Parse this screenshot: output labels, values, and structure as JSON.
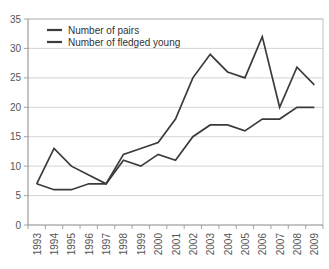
{
  "chart_data": {
    "type": "line",
    "title": "",
    "xlabel": "",
    "ylabel": "",
    "x": [
      1993,
      1994,
      1995,
      1996,
      1997,
      1998,
      1999,
      2000,
      2001,
      2002,
      2003,
      2004,
      2005,
      2006,
      2007,
      2008,
      2009
    ],
    "categories": [
      "1993",
      "1994",
      "1995",
      "1996",
      "1997",
      "1998",
      "1999",
      "2000",
      "2001",
      "2002",
      "2003",
      "2004",
      "2005",
      "2006",
      "2007",
      "2008",
      "2009"
    ],
    "series": [
      {
        "name": "Number of pairs",
        "values": [
          7,
          6,
          6,
          7,
          7,
          11,
          10,
          12,
          11,
          15,
          17,
          17,
          16,
          18,
          18,
          20,
          20
        ]
      },
      {
        "name": "Number of fledged young",
        "values": [
          7,
          13,
          10,
          8.5,
          7,
          12,
          13,
          14,
          18,
          25,
          29,
          26,
          25,
          32,
          20,
          26.8,
          23.8
        ]
      }
    ],
    "ylim": [
      0,
      35
    ],
    "yticks": [
      0,
      5,
      10,
      15,
      20,
      25,
      30,
      35
    ],
    "ytick_labels": [
      "0",
      "5",
      "10",
      "15",
      "20",
      "25",
      "30",
      "35"
    ],
    "grid": true,
    "legend_position": "top-left",
    "legend_entries": [
      "Number of pairs",
      "Number of fledged young"
    ],
    "colors": {
      "series_line": "#3b3b3b",
      "gridline": "#c9c9c9",
      "axis": "#888888",
      "background": "#ffffff",
      "text": "#555555"
    }
  }
}
